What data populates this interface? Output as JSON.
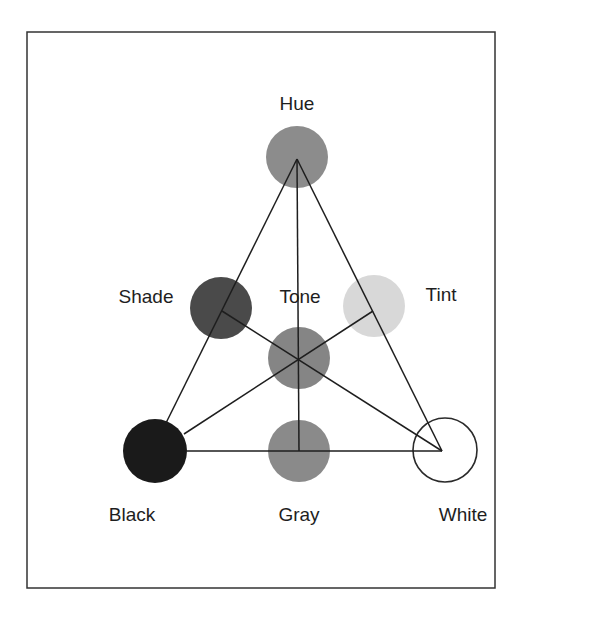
{
  "diagram": {
    "nodes": [
      {
        "id": "hue",
        "label": "Hue",
        "cx": 297,
        "cy": 157,
        "r": 31,
        "fill": "#8c8c8c",
        "stroke": "none",
        "label_x": 297,
        "label_y": 94
      },
      {
        "id": "shade",
        "label": "Shade",
        "cx": 221,
        "cy": 308,
        "r": 31,
        "fill": "#4a4a4a",
        "stroke": "none",
        "label_x": 146,
        "label_y": 287
      },
      {
        "id": "tone",
        "label": "Tone",
        "cx": 299,
        "cy": 358,
        "r": 31,
        "fill": "#858585",
        "stroke": "none",
        "label_x": 300,
        "label_y": 287
      },
      {
        "id": "tint",
        "label": "Tint",
        "cx": 374,
        "cy": 306,
        "r": 31,
        "fill": "#d8d8d8",
        "stroke": "none",
        "label_x": 441,
        "label_y": 285
      },
      {
        "id": "black",
        "label": "Black",
        "cx": 155,
        "cy": 451,
        "r": 32,
        "fill": "#1a1a1a",
        "stroke": "none",
        "label_x": 132,
        "label_y": 505
      },
      {
        "id": "gray",
        "label": "Gray",
        "cx": 299,
        "cy": 451,
        "r": 31,
        "fill": "#8a8a8a",
        "stroke": "none",
        "label_x": 299,
        "label_y": 505
      },
      {
        "id": "white",
        "label": "White",
        "cx": 445,
        "cy": 450,
        "r": 32,
        "fill": "#ffffff",
        "stroke": "#2a2a2a",
        "label_x": 463,
        "label_y": 505
      }
    ],
    "edges": [
      {
        "from": "hue",
        "to": "black",
        "x1": 297,
        "y1": 159,
        "x2": 166,
        "y2": 423
      },
      {
        "from": "hue",
        "to": "white",
        "x1": 297,
        "y1": 159,
        "x2": 442,
        "y2": 451
      },
      {
        "from": "black",
        "to": "white",
        "x1": 187,
        "y1": 451,
        "x2": 442,
        "y2": 451
      },
      {
        "from": "hue",
        "to": "gray",
        "x1": 297,
        "y1": 159,
        "x2": 299,
        "y2": 451
      },
      {
        "from": "black",
        "to": "tint",
        "x1": 184,
        "y1": 434,
        "x2": 373,
        "y2": 311
      },
      {
        "from": "white",
        "to": "shade",
        "x1": 442,
        "y1": 451,
        "x2": 222,
        "y2": 311
      }
    ],
    "frame": {
      "x": 27,
      "y": 32,
      "width": 468,
      "height": 556,
      "stroke": "#333333"
    }
  }
}
